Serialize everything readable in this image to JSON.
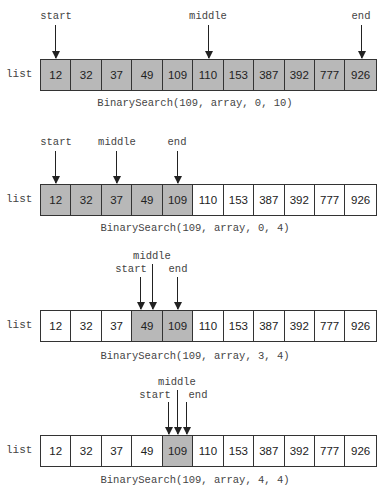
{
  "list_label": "list",
  "values": [
    "12",
    "32",
    "37",
    "49",
    "109",
    "110",
    "153",
    "387",
    "392",
    "777",
    "926"
  ],
  "steps": [
    {
      "caption": "BinarySearch(109, array, 0, 10)",
      "active_range": [
        0,
        10
      ],
      "pointers": {
        "start": 0,
        "middle": 5,
        "end": 10
      },
      "labels": {
        "start": "start",
        "middle": "middle",
        "end": "end"
      }
    },
    {
      "caption": "BinarySearch(109, array, 0, 4)",
      "active_range": [
        0,
        4
      ],
      "pointers": {
        "start": 0,
        "middle": 2,
        "end": 4
      },
      "labels": {
        "start": "start",
        "middle": "middle",
        "end": "end"
      }
    },
    {
      "caption": "BinarySearch(109, array, 3, 4)",
      "active_range": [
        3,
        4
      ],
      "pointers": {
        "start": 3,
        "middle": 3,
        "end": 4
      },
      "labels": {
        "start": "start",
        "middle": "middle",
        "end": "end"
      }
    },
    {
      "caption": "BinarySearch(109, array, 4, 4)",
      "active_range": [
        4,
        4
      ],
      "pointers": {
        "start": 4,
        "middle": 4,
        "end": 4
      },
      "labels": {
        "start": "start",
        "middle": "middle",
        "end": "end"
      }
    }
  ],
  "colors": {
    "active_cell": "#b8b8b8",
    "inactive_cell": "#ffffff",
    "border": "#333333"
  }
}
